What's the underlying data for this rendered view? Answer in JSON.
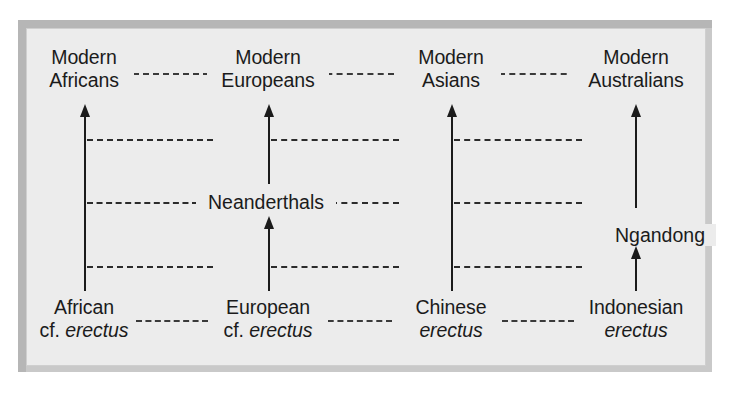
{
  "figure": {
    "kind": "multiregional-evolution-diagram",
    "background_color": "#ececec",
    "frame_color": "#b6b6b6",
    "ink_color": "#1b1b1b"
  },
  "columns": [
    {
      "id": "african",
      "top_label_line1": "Modern",
      "top_label_line2": "Africans",
      "bottom_label_line1": "African",
      "bottom_label_line2_plain": "cf. ",
      "bottom_label_line2_italic": "erectus"
    },
    {
      "id": "european",
      "top_label_line1": "Modern",
      "top_label_line2": "Europeans",
      "bottom_label_line1": "European",
      "bottom_label_line2_plain": "cf. ",
      "bottom_label_line2_italic": "erectus"
    },
    {
      "id": "asian",
      "top_label_line1": "Modern",
      "top_label_line2": "Asians",
      "bottom_label_line1": "Chinese",
      "bottom_label_line2_plain": "",
      "bottom_label_line2_italic": "erectus"
    },
    {
      "id": "australian",
      "top_label_line1": "Modern",
      "top_label_line2": "Australians",
      "bottom_label_line1": "Indonesian",
      "bottom_label_line2_plain": "",
      "bottom_label_line2_italic": "erectus"
    }
  ],
  "intermediate_nodes": [
    {
      "id": "neanderthals",
      "label": "Neanderthals"
    },
    {
      "id": "ngandong",
      "label": "Ngandong"
    }
  ]
}
